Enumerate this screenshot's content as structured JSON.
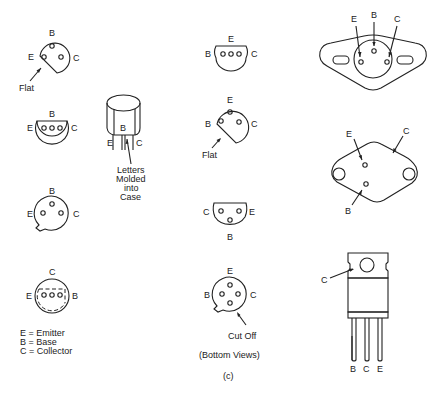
{
  "figure": {
    "caption": "(c)",
    "view_note": "(Bottom Views)",
    "legend": [
      "E = Emitter",
      "B = Base",
      "C = Collector"
    ]
  },
  "packages": [
    {
      "id": "pkg1",
      "pins": {
        "top": "B",
        "left": "E",
        "right": "C"
      },
      "annotation": "Flat"
    },
    {
      "id": "pkg2",
      "pins": {
        "top": "B",
        "left": "E",
        "right": "C"
      }
    },
    {
      "id": "pkg3",
      "pins": {
        "top": "B",
        "left": "E",
        "right": "C"
      }
    },
    {
      "id": "pkg4",
      "pins": {
        "top": "C",
        "left": "E",
        "right": "B"
      }
    },
    {
      "id": "to92",
      "pins": {
        "b": "B",
        "e": "E",
        "c": "C"
      },
      "annotation": [
        "Letters",
        "Molded",
        "into",
        "Case"
      ]
    },
    {
      "id": "pkg5",
      "pins": {
        "top": "E",
        "left": "B",
        "right": "C"
      }
    },
    {
      "id": "pkg6",
      "pins": {
        "top": "E",
        "left": "B",
        "right": "C"
      },
      "annotation": "Flat"
    },
    {
      "id": "pkg7",
      "pins": {
        "left": "C",
        "right": "E",
        "bottom": "B"
      }
    },
    {
      "id": "pkg8",
      "pins": {
        "top": "E",
        "left": "B",
        "right": "C"
      },
      "annotation": "Cut Off"
    },
    {
      "id": "to66",
      "pins": {
        "e": "E",
        "b": "B",
        "c": "C"
      }
    },
    {
      "id": "to3",
      "pins": {
        "e": "E",
        "c": "C",
        "b": "B"
      }
    },
    {
      "id": "to220",
      "pins": {
        "tab": "C",
        "leg1": "B",
        "leg2": "C",
        "leg3": "E"
      }
    }
  ]
}
